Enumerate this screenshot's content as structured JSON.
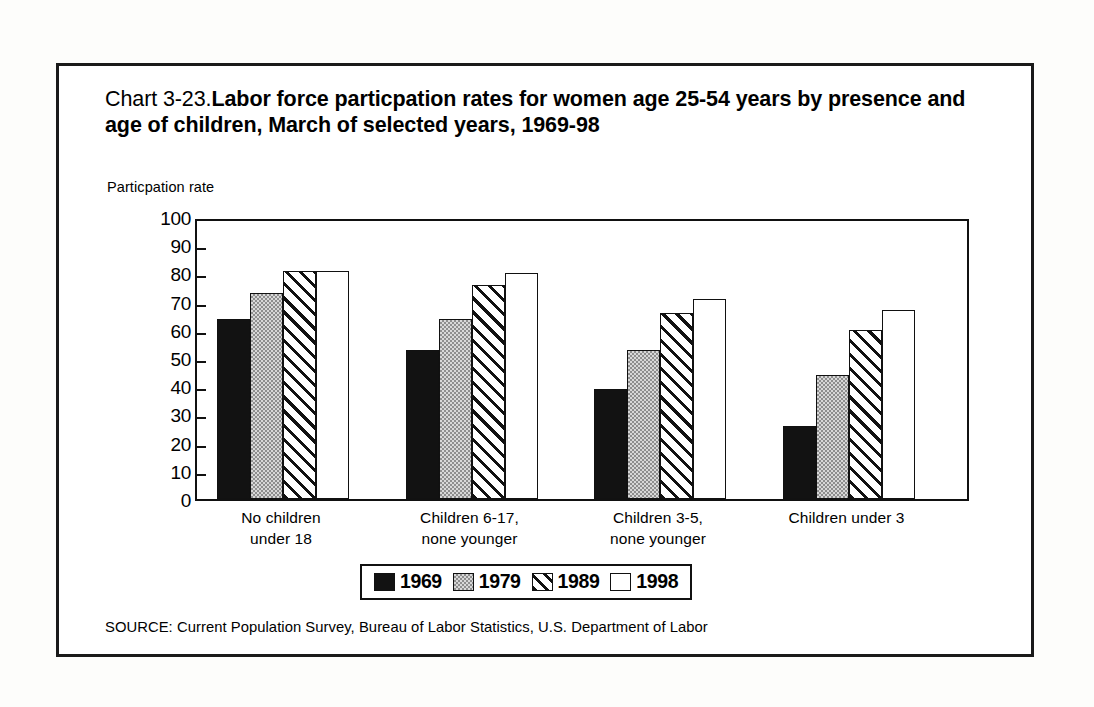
{
  "figure": {
    "title_prefix": "Chart 3-23.",
    "title_main": "Labor force particpation rates for women age 25-54 years by presence and age of children, March of selected years, 1969-98",
    "y_axis_label": "Particpation rate",
    "source_note": "SOURCE: Current Population Survey, Bureau of Labor Statistics, U.S. Department of Labor"
  },
  "chart_data": {
    "type": "bar",
    "xlabel": "",
    "ylabel": "Particpation rate",
    "ylim": [
      0,
      100
    ],
    "yticks": [
      0,
      10,
      20,
      30,
      40,
      50,
      60,
      70,
      80,
      90,
      100
    ],
    "ytick_labels": [
      "0",
      "10",
      "20",
      "30",
      "40",
      "50",
      "60",
      "70",
      "80",
      "90",
      "100"
    ],
    "grid": false,
    "legend_position": "bottom",
    "categories": [
      "No children\nunder 18",
      "Children 6-17,\nnone younger",
      "Children 3-5,\nnone younger",
      "Children under 3"
    ],
    "category_lines": [
      [
        "No children",
        "under 18"
      ],
      [
        "Children 6-17,",
        "none younger"
      ],
      [
        "Children 3-5,",
        "none younger"
      ],
      [
        "Children under 3"
      ]
    ],
    "series": [
      {
        "name": "1969",
        "pattern": "solid-black",
        "color": "#121212",
        "values": [
          64,
          53,
          39,
          26
        ]
      },
      {
        "name": "1979",
        "pattern": "gray-stipple",
        "color": "#b9b9b9",
        "values": [
          73,
          64,
          53,
          44
        ]
      },
      {
        "name": "1989",
        "pattern": "diagonal-hatch",
        "color": "#ffffff",
        "values": [
          81,
          76,
          66,
          60
        ]
      },
      {
        "name": "1998",
        "pattern": "white-empty",
        "color": "#ffffff",
        "values": [
          81,
          80,
          71,
          67
        ]
      }
    ]
  },
  "legend": {
    "entries": [
      {
        "label": "1969",
        "swatch": "solid-black-swatch"
      },
      {
        "label": "1979",
        "swatch": "gray-stipple-swatch"
      },
      {
        "label": "1989",
        "swatch": "diagonal-hatch-swatch"
      },
      {
        "label": "1998",
        "swatch": "white-empty-swatch"
      }
    ]
  }
}
